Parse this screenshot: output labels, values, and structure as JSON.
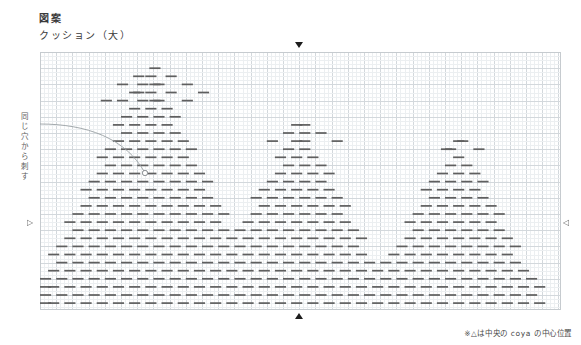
{
  "document": {
    "title_main": "図案",
    "title_sub": "クッション（大）",
    "side_note": "同じ穴から刺す",
    "footnote": "※△は中央の coya の中心位置"
  },
  "markers": {
    "top": {
      "glyph": "▼",
      "name": "center-mark-top",
      "x": 298,
      "y": 45
    },
    "bottom": {
      "glyph": "▲",
      "name": "center-mark-bottom",
      "x": 298,
      "y": 318
    },
    "left": {
      "glyph": "▷",
      "name": "row-mark-left",
      "x": 31,
      "y": 223
    },
    "right": {
      "glyph": "◁",
      "name": "row-mark-right",
      "x": 566,
      "y": 223
    }
  },
  "colors": {
    "stitch": "#5f5f5f",
    "grid_minor": "#eceff1",
    "grid_major": "#d3d8dc",
    "frame": "#c6cbcf",
    "arc": "#9aa0a4",
    "text": "#3a3a3a"
  },
  "chart_data": {
    "type": "heatmap",
    "title": "図案 クッション（大）",
    "subtitle": "sashiko stitch chart — coya motif repeat",
    "xlabel": "",
    "ylabel": "",
    "grid": true,
    "legend": "none",
    "axis": {
      "cell_px": 4.05,
      "minor_per_major": 4,
      "cols": 128,
      "rows": 63,
      "origin_px": [
        40,
        52
      ],
      "width_px": 521,
      "height_px": 258
    },
    "stitch": {
      "dash_length_cells": 3,
      "dash_gap_cells": 1,
      "row_pitch_cells": 2,
      "dash_height_px": 1.7
    },
    "motifs": [
      {
        "name": "coya-left",
        "apex_col": 27,
        "apex_row": 4,
        "base_row": 62,
        "half_width_cells": 29
      },
      {
        "name": "coya-center",
        "apex_col": 64,
        "apex_row": 18,
        "base_row": 62,
        "half_width_cells": 24
      },
      {
        "name": "coya-right",
        "apex_col": 103,
        "apex_row": 22,
        "base_row": 62,
        "half_width_cells": 22
      }
    ],
    "annotation_arc": {
      "label": "同じ穴から刺す",
      "from_px": [
        0,
        72
      ],
      "to_px": [
        105,
        121
      ],
      "endpoint_marker": "circle"
    }
  }
}
